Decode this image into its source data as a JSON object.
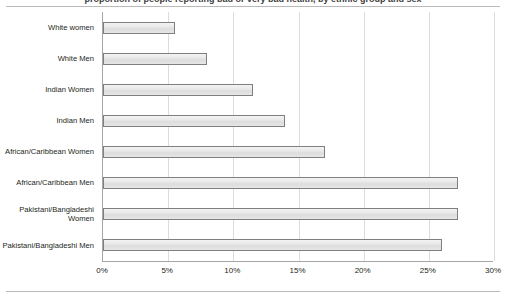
{
  "figure": {
    "clipped_caption": "proportion of people reporting bad or very bad health, by ethnic group and sex"
  },
  "chart_data": {
    "type": "bar",
    "orientation": "horizontal",
    "title": "",
    "subtitle": "",
    "xlabel": "",
    "ylabel": "",
    "categories": [
      "White women",
      "White Men",
      "Indian Women",
      "Indian Men",
      "African/Caribbean Women",
      "African/Caribbean Men",
      "Pakistani/Bangladeshi Women",
      "Pakistani/Bangladeshi Men"
    ],
    "values": [
      5.5,
      8.0,
      11.5,
      14.0,
      17.0,
      27.2,
      27.2,
      26.0
    ],
    "value_labels": [
      "5.5%",
      "8%",
      "11.5%",
      "14%",
      "17%",
      "27%",
      "27%",
      "26%"
    ],
    "xlim": [
      0,
      30
    ],
    "xticks": [
      0,
      5,
      10,
      15,
      20,
      25,
      30
    ],
    "xtick_labels": [
      "0%",
      "5%",
      "10%",
      "15%",
      "20%",
      "25%",
      "30%"
    ],
    "grid": true,
    "grid_axis": "x",
    "legend": false,
    "legend_entries": [],
    "bar_fill_color": "#e8e8e8",
    "bar_border_color": "#7f7f7f",
    "axis_color": "#a6a6a6",
    "grid_color": "#dcdcdc",
    "background_color": "#ffffff"
  }
}
